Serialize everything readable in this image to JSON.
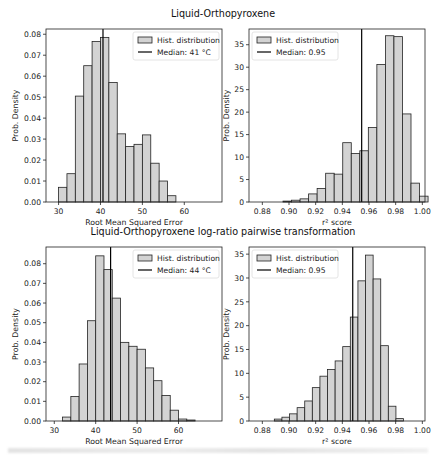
{
  "figure": {
    "row_titles": [
      "Liquid-Orthopyroxene",
      "Liquid-Orthopyroxene log-ratio pairwise transformation"
    ],
    "bar_fill": "#d3d3d3",
    "bar_edge": "#222222",
    "median_color": "#000000"
  },
  "chart_data": [
    {
      "type": "bar",
      "title": "Liquid-Orthopyroxene",
      "xlabel": "Root Mean Squared Error",
      "ylabel": "Prob. Density",
      "xlim": [
        27,
        69
      ],
      "ylim": [
        0,
        0.0825
      ],
      "xticks": [
        30,
        40,
        50,
        60
      ],
      "xtick_labels": [
        "30",
        "40",
        "50",
        "60"
      ],
      "yticks": [
        0,
        0.01,
        0.02,
        0.03,
        0.04,
        0.05,
        0.06,
        0.07,
        0.08
      ],
      "ytick_labels": [
        "0.00",
        "0.01",
        "0.02",
        "0.03",
        "0.04",
        "0.05",
        "0.06",
        "0.07",
        "0.08"
      ],
      "bin_start": 30,
      "bin_width": 2,
      "values": [
        0.007,
        0.0135,
        0.0505,
        0.065,
        0.0765,
        0.0785,
        0.057,
        0.0325,
        0.0265,
        0.0275,
        0.032,
        0.0185,
        0.01,
        0.003
      ],
      "median": 40.6,
      "legend": {
        "hist_label": "Hist. distribution",
        "median_label": "Median: 41 °C",
        "position": "upper right"
      },
      "box": {
        "x": 46,
        "y": 29,
        "w": 176,
        "h": 173
      }
    },
    {
      "type": "bar",
      "title": "Liquid-Orthopyroxene",
      "xlabel": "r² score",
      "ylabel": "Prob. Density",
      "xlim": [
        0.87,
        1.002
      ],
      "ylim": [
        0,
        38.5
      ],
      "xticks": [
        0.88,
        0.9,
        0.92,
        0.94,
        0.96,
        0.98,
        1.0
      ],
      "xtick_labels": [
        "0.88",
        "0.90",
        "0.92",
        "0.94",
        "0.96",
        "0.98",
        "1.00"
      ],
      "yticks": [
        0,
        5,
        10,
        15,
        20,
        25,
        30,
        35
      ],
      "ytick_labels": [
        "0",
        "5",
        "10",
        "15",
        "20",
        "25",
        "30",
        "35"
      ],
      "bin_start": 0.8955,
      "bin_width": 0.0064,
      "values": [
        0.2,
        0.4,
        0.7,
        1.8,
        3.0,
        6.4,
        6.2,
        13.2,
        10.8,
        11.4,
        16.6,
        30.6,
        37.0,
        36.8,
        19.6,
        4.2,
        1.3
      ],
      "median": 0.9545,
      "legend": {
        "hist_label": "Hist. distribution",
        "median_label": "Median: 0.95",
        "position": "upper left"
      },
      "box": {
        "x": 249,
        "y": 29,
        "w": 176,
        "h": 173
      }
    },
    {
      "type": "bar",
      "title": "Liquid-Orthopyroxene log-ratio pairwise transformation",
      "xlabel": "Root Mean Squared Error",
      "ylabel": "Prob. Density",
      "xlim": [
        28,
        70.5
      ],
      "ylim": [
        0,
        0.0885
      ],
      "xticks": [
        30,
        40,
        50,
        60
      ],
      "xtick_labels": [
        "30",
        "40",
        "50",
        "60"
      ],
      "yticks": [
        0,
        0.01,
        0.02,
        0.03,
        0.04,
        0.05,
        0.06,
        0.07,
        0.08
      ],
      "ytick_labels": [
        "0.00",
        "0.01",
        "0.02",
        "0.03",
        "0.04",
        "0.05",
        "0.06",
        "0.07",
        "0.08"
      ],
      "bin_start": 32,
      "bin_width": 2,
      "values": [
        0.002,
        0.0125,
        0.029,
        0.051,
        0.084,
        0.077,
        0.0625,
        0.04,
        0.038,
        0.0365,
        0.027,
        0.0205,
        0.013,
        0.0055,
        0.001,
        0.0005
      ],
      "median": 43.6,
      "legend": {
        "hist_label": "Hist. distribution",
        "median_label": "Median: 44 °C",
        "position": "upper right"
      },
      "box": {
        "x": 46,
        "y": 247,
        "w": 176,
        "h": 174
      }
    },
    {
      "type": "bar",
      "title": "Liquid-Orthopyroxene log-ratio pairwise transformation",
      "xlabel": "r² score",
      "ylabel": "Prob. Density",
      "xlim": [
        0.87,
        1.002
      ],
      "ylim": [
        0,
        36.5
      ],
      "xticks": [
        0.88,
        0.9,
        0.92,
        0.94,
        0.96,
        0.98,
        1.0
      ],
      "xtick_labels": [
        "0.88",
        "0.90",
        "0.92",
        "0.94",
        "0.96",
        "0.98",
        "1.00"
      ],
      "yticks": [
        0,
        5,
        10,
        15,
        20,
        25,
        30,
        35
      ],
      "ytick_labels": [
        "0",
        "5",
        "10",
        "15",
        "20",
        "25",
        "30",
        "35"
      ],
      "bin_start": 0.889,
      "bin_width": 0.0057,
      "values": [
        0.4,
        0.8,
        1.5,
        2.8,
        4.2,
        7.0,
        9.4,
        10.8,
        12.6,
        15.6,
        21.8,
        29.4,
        34.8,
        29.8,
        15.8,
        3.1,
        0.5
      ],
      "median": 0.9478,
      "legend": {
        "hist_label": "Hist. distribution",
        "median_label": "Median: 0.95",
        "position": "upper left"
      },
      "box": {
        "x": 249,
        "y": 247,
        "w": 176,
        "h": 174
      }
    }
  ]
}
